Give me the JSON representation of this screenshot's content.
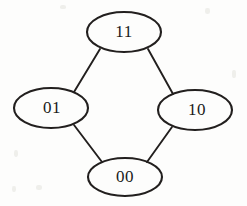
{
  "diagram": {
    "type": "undirected-graph",
    "background_color": "#fdfdfc",
    "stroke_color": "#221f1e",
    "text_color": "#1a1a1a",
    "nodes": [
      {
        "id": "top",
        "label": "11",
        "cx": 124,
        "cy": 32,
        "rx": 37,
        "ry": 20,
        "label_x": 124,
        "label_y": 32
      },
      {
        "id": "left",
        "label": "01",
        "cx": 51,
        "cy": 108,
        "rx": 37,
        "ry": 20,
        "label_x": 52,
        "label_y": 108
      },
      {
        "id": "right",
        "label": "10",
        "cx": 195,
        "cy": 110,
        "rx": 37,
        "ry": 20,
        "label_x": 197,
        "label_y": 110
      },
      {
        "id": "bottom",
        "label": "00",
        "cx": 125,
        "cy": 177,
        "rx": 37,
        "ry": 19,
        "label_x": 125,
        "label_y": 177
      }
    ],
    "edges": [
      {
        "id": "edge-11-01",
        "from": "11",
        "to": "01",
        "x1": 100,
        "y1": 49,
        "x2": 74,
        "y2": 92
      },
      {
        "id": "edge-11-10",
        "from": "11",
        "to": "10",
        "x1": 148,
        "y1": 49,
        "x2": 173,
        "y2": 94
      },
      {
        "id": "edge-01-00",
        "from": "01",
        "to": "00",
        "x1": 74,
        "y1": 125,
        "x2": 102,
        "y2": 162
      },
      {
        "id": "edge-10-00",
        "from": "10",
        "to": "00",
        "x1": 172,
        "y1": 127,
        "x2": 147,
        "y2": 162
      }
    ],
    "specks": [
      {
        "x": 14,
        "y": 150,
        "w": 4,
        "h": 7
      },
      {
        "x": 12,
        "y": 186,
        "w": 4,
        "h": 6
      },
      {
        "x": 36,
        "y": 185,
        "w": 6,
        "h": 5
      },
      {
        "x": 205,
        "y": 8,
        "w": 5,
        "h": 6
      },
      {
        "x": 232,
        "y": 70,
        "w": 4,
        "h": 8
      },
      {
        "x": 60,
        "y": 5,
        "w": 6,
        "h": 4
      }
    ]
  }
}
